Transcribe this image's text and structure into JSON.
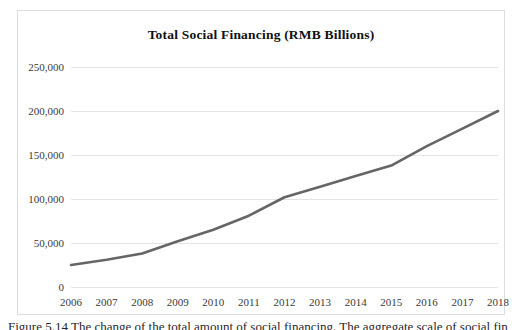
{
  "figure": {
    "caption": "Figure 5.14 The change of the total amount of social financing. The aggregate scale of social financing (TSF)"
  },
  "chart_data": {
    "type": "line",
    "title": "Total Social Financing (RMB Billions)",
    "xlabel": "",
    "ylabel": "",
    "categories": [
      "2006",
      "2007",
      "2008",
      "2009",
      "2010",
      "2011",
      "2012",
      "2013",
      "2014",
      "2015",
      "2016",
      "2017",
      "2018"
    ],
    "values": [
      25000,
      31000,
      38000,
      52000,
      65000,
      81000,
      102000,
      114000,
      126000,
      138000,
      160000,
      180000,
      200000
    ],
    "series": [
      {
        "name": "Total Social Financing",
        "values": [
          25000,
          31000,
          38000,
          52000,
          65000,
          81000,
          102000,
          114000,
          126000,
          138000,
          160000,
          180000,
          200000
        ]
      }
    ],
    "ylim": [
      0,
      250000
    ],
    "yticks": [
      0,
      50000,
      100000,
      150000,
      200000,
      250000
    ],
    "ytick_labels": [
      "0",
      "50,000",
      "100,000",
      "150,000",
      "200,000",
      "250,000"
    ],
    "grid": true,
    "legend": false,
    "line_color": "#666666",
    "grid_color": "#e4e4e4",
    "frame_color": "#dcdcdc"
  }
}
